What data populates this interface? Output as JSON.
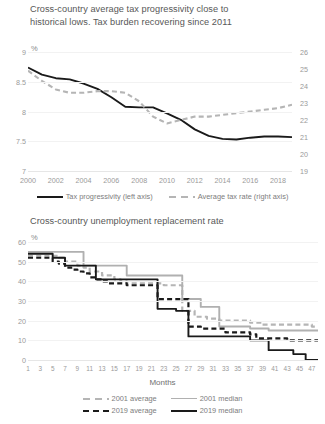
{
  "charts": [
    {
      "id": "tax-progressivity",
      "title": "Cross-country average tax progressivity close to\nhistorical lows. Tax burden recovering since 2011",
      "unit_label": "%",
      "legend": [
        {
          "label": "Tax progressivity (left axis)",
          "style": "solid-black"
        },
        {
          "label": "Average tax rate (right axis)",
          "style": "dash-gray"
        }
      ],
      "chart_data": {
        "type": "line",
        "title": "Cross-country average tax progressivity close to historical lows. Tax burden recovering since 2011",
        "xlabel": "",
        "ylabel": "%",
        "grid": true,
        "legend_position": "bottom",
        "x": [
          2000,
          2001,
          2002,
          2003,
          2004,
          2005,
          2006,
          2007,
          2008,
          2009,
          2010,
          2011,
          2012,
          2013,
          2014,
          2015,
          2016,
          2017,
          2018,
          2019
        ],
        "xtick_labels": [
          "2000",
          "2002",
          "2004",
          "2006",
          "2008",
          "2010",
          "2012",
          "2014",
          "2016",
          "2018"
        ],
        "ylim": [
          7,
          9
        ],
        "ytick_labels": [
          "7",
          "7.5",
          "8",
          "8.5",
          "9"
        ],
        "y2lim": [
          19,
          26
        ],
        "y2tick_labels": [
          "19",
          "20",
          "21",
          "22",
          "23",
          "24",
          "25",
          "26"
        ],
        "series": [
          {
            "name": "Tax progressivity (left axis)",
            "axis": "left",
            "style": "solid",
            "color": "#1a1a1a",
            "values": [
              8.74,
              8.62,
              8.56,
              8.54,
              8.47,
              8.38,
              8.24,
              8.08,
              8.07,
              8.07,
              7.97,
              7.86,
              7.7,
              7.59,
              7.54,
              7.53,
              7.56,
              7.58,
              7.58,
              7.57
            ]
          },
          {
            "name": "Average tax rate (right axis)",
            "axis": "right",
            "style": "dashed",
            "color": "#b5b5b5",
            "values": [
              24.9,
              24.3,
              23.8,
              23.6,
              23.6,
              23.7,
              23.7,
              23.6,
              23.1,
              22.2,
              21.8,
              22.0,
              22.2,
              22.2,
              22.3,
              22.4,
              22.5,
              22.6,
              22.7,
              22.9
            ]
          }
        ]
      }
    },
    {
      "id": "unemployment-replacement-rate",
      "title": "Cross-country unemployment replacement rate",
      "unit_label": "%",
      "xlabel": "Months",
      "legend": [
        {
          "label": "2001 average",
          "style": "dash-gray"
        },
        {
          "label": "2001 median",
          "style": "solid-gray"
        },
        {
          "label": "2019 average",
          "style": "dash-black"
        },
        {
          "label": "2019 median",
          "style": "solid-black"
        }
      ],
      "chart_data": {
        "type": "line",
        "title": "Cross-country unemployment replacement rate",
        "xlabel": "Months",
        "ylabel": "%",
        "grid": true,
        "legend_position": "bottom",
        "x": [
          1,
          2,
          3,
          4,
          5,
          6,
          7,
          8,
          9,
          10,
          11,
          12,
          13,
          14,
          15,
          16,
          17,
          18,
          19,
          20,
          21,
          22,
          23,
          24,
          25,
          26,
          27,
          28,
          29,
          30,
          31,
          32,
          33,
          34,
          35,
          36,
          37,
          38,
          39,
          40,
          41,
          42,
          43,
          44,
          45,
          46,
          47,
          48
        ],
        "xtick_labels": [
          "1",
          "3",
          "5",
          "7",
          "9",
          "11",
          "13",
          "15",
          "17",
          "19",
          "21",
          "23",
          "25",
          "27",
          "29",
          "31",
          "33",
          "35",
          "37",
          "39",
          "41",
          "43",
          "45",
          "47"
        ],
        "ylim": [
          0,
          60
        ],
        "ytick_labels": [
          "0",
          "10",
          "20",
          "30",
          "40",
          "50",
          "60"
        ],
        "series": [
          {
            "name": "2001 average",
            "style": "dashed",
            "color": "#b5b5b5",
            "values": [
              53,
              53,
              53,
              53,
              53,
              52,
              50,
              50,
              48,
              47,
              45,
              45,
              43,
              43,
              41,
              40,
              39,
              39,
              39,
              39,
              39,
              39,
              38,
              38,
              38,
              25,
              25,
              22,
              22,
              21,
              21,
              20,
              20,
              20,
              20,
              20,
              19,
              19,
              18,
              18,
              18,
              18,
              18,
              18,
              18,
              18,
              17,
              17
            ]
          },
          {
            "name": "2001 median",
            "style": "solid",
            "color": "#b0b0b0",
            "values": [
              55,
              55,
              55,
              55,
              55,
              55,
              55,
              55,
              55,
              48,
              48,
              48,
              48,
              48,
              48,
              48,
              43,
              43,
              43,
              43,
              43,
              43,
              43,
              43,
              43,
              31,
              31,
              31,
              27,
              27,
              27,
              17,
              17,
              17,
              17,
              17,
              16,
              16,
              16,
              15,
              15,
              15,
              15,
              15,
              15,
              15,
              15,
              15
            ]
          },
          {
            "name": "2019 average",
            "style": "dashed",
            "color": "#1a1a1a",
            "values": [
              52,
              52,
              52,
              52,
              50,
              49,
              47,
              46,
              45,
              44,
              42,
              41,
              40,
              39,
              39,
              39,
              38,
              38,
              38,
              38,
              38,
              31,
              31,
              31,
              31,
              31,
              17,
              17,
              16,
              16,
              16,
              16,
              14,
              14,
              14,
              14,
              13,
              11,
              11,
              11,
              11,
              11,
              10,
              10,
              10,
              10,
              10,
              10
            ]
          },
          {
            "name": "2019 median",
            "style": "solid",
            "color": "#1a1a1a",
            "values": [
              54,
              54,
              54,
              54,
              52,
              52,
              48,
              48,
              48,
              48,
              48,
              41,
              41,
              41,
              41,
              41,
              41,
              41,
              41,
              41,
              41,
              26,
              26,
              26,
              25,
              25,
              12,
              12,
              12,
              12,
              12,
              12,
              12,
              12,
              12,
              12,
              10,
              10,
              10,
              5,
              5,
              5,
              5,
              3,
              3,
              0,
              0,
              0
            ]
          }
        ]
      }
    }
  ]
}
